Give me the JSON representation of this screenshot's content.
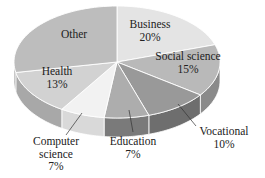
{
  "chart_data": {
    "type": "pie",
    "style": "3d",
    "title": "",
    "categories": [
      "Business",
      "Social science",
      "Vocational",
      "Education",
      "Computer science",
      "Health",
      "Other"
    ],
    "values": [
      20,
      15,
      10,
      7,
      7,
      13,
      28
    ],
    "value_labels": [
      "20%",
      "15%",
      "10%",
      "7%",
      "7%",
      "13%",
      ""
    ],
    "colors": [
      "#e4e4e4",
      "#b9b9b9",
      "#999999",
      "#adadad",
      "#f2f2f2",
      "#d2d2d2",
      "#bdbdbd"
    ],
    "side_colors": [
      "#c9c9c9",
      "#8a8a8a",
      "#6e6e6e",
      "#7a7a7a",
      "#d9d9d9",
      "#a8a8a8",
      "#a3a3a3"
    ],
    "legend": "none (labels on/near slices)"
  },
  "labels": [
    {
      "name": "Business",
      "lines": [
        "Business",
        "20%"
      ],
      "x": 150,
      "y": 28
    },
    {
      "name": "Social science",
      "lines": [
        "Social science",
        "15%"
      ],
      "x": 188,
      "y": 60
    },
    {
      "name": "Vocational",
      "lines": [
        "Vocational",
        "10%"
      ],
      "x": 224,
      "y": 135
    },
    {
      "name": "Education",
      "lines": [
        "Education",
        "7%"
      ],
      "x": 133,
      "y": 145
    },
    {
      "name": "Computer science",
      "lines": [
        "Computer",
        "science",
        "7%"
      ],
      "x": 56,
      "y": 145
    },
    {
      "name": "Health",
      "lines": [
        "Health",
        "13%"
      ],
      "x": 57,
      "y": 75
    },
    {
      "name": "Other",
      "lines": [
        "Other"
      ],
      "x": 74,
      "y": 38
    }
  ]
}
